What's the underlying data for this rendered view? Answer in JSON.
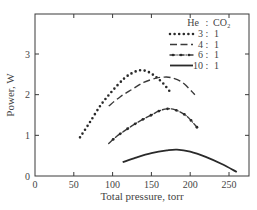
{
  "chart_data": {
    "type": "line",
    "title": "",
    "xlabel": "Total pressure, torr",
    "ylabel": "Power, W",
    "xlim": [
      0,
      275
    ],
    "ylim": [
      0,
      3.9
    ],
    "xticks": [
      0,
      50,
      100,
      150,
      200,
      250
    ],
    "yticks": [
      0,
      1,
      2,
      3
    ],
    "grid": false,
    "legend": {
      "position": "upper right",
      "header": [
        "He",
        ":",
        "CO₂"
      ],
      "entries": [
        {
          "style": "dotted",
          "ratio_he": "3",
          "sep": ":",
          "ratio_co2": "1"
        },
        {
          "style": "dashed",
          "ratio_he": "4",
          "sep": ":",
          "ratio_co2": "1"
        },
        {
          "style": "dash-dot",
          "ratio_he": "6",
          "sep": ":",
          "ratio_co2": "1"
        },
        {
          "style": "solid",
          "ratio_he": "10",
          "sep": ":",
          "ratio_co2": "1"
        }
      ]
    },
    "series": [
      {
        "name": "He:CO2 = 3:1",
        "style": "dotted",
        "x": [
          58,
          70,
          85,
          100,
          115,
          125,
          135,
          145,
          155,
          165,
          175
        ],
        "y": [
          0.95,
          1.3,
          1.75,
          2.1,
          2.4,
          2.53,
          2.6,
          2.57,
          2.45,
          2.28,
          2.05
        ]
      },
      {
        "name": "He:CO2 = 4:1",
        "style": "dashed",
        "x": [
          95,
          110,
          125,
          140,
          155,
          165,
          175,
          190,
          206
        ],
        "y": [
          1.72,
          1.95,
          2.13,
          2.3,
          2.4,
          2.43,
          2.42,
          2.3,
          2.0
        ]
      },
      {
        "name": "He:CO2 = 6:1",
        "style": "dash-dot",
        "x": [
          95,
          105,
          120,
          135,
          150,
          160,
          170,
          180,
          195,
          210
        ],
        "y": [
          0.8,
          0.97,
          1.17,
          1.35,
          1.5,
          1.6,
          1.65,
          1.63,
          1.48,
          1.17
        ]
      },
      {
        "name": "He:CO2 = 10:1",
        "style": "solid",
        "x": [
          113,
          130,
          150,
          170,
          183,
          200,
          220,
          240,
          260
        ],
        "y": [
          0.34,
          0.45,
          0.56,
          0.63,
          0.65,
          0.6,
          0.47,
          0.3,
          0.1
        ]
      }
    ]
  }
}
